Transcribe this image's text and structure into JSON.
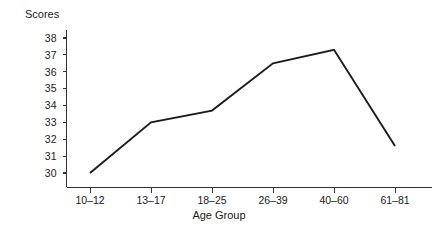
{
  "chart_data": {
    "type": "line",
    "title": "",
    "xlabel": "Age Group",
    "ylabel": "Scores",
    "categories": [
      "10–12",
      "13–17",
      "18–25",
      "26–39",
      "40–60",
      "61–81"
    ],
    "values": [
      30.0,
      33.0,
      33.7,
      36.5,
      37.3,
      31.6
    ],
    "ylim": [
      29.4,
      38.4
    ],
    "yticks": [
      30,
      31,
      32,
      33,
      34,
      35,
      36,
      37,
      38
    ],
    "ytick_labels": [
      "30",
      "31",
      "32",
      "33",
      "34",
      "35",
      "36",
      "37",
      "38"
    ],
    "grid": false,
    "legend": false,
    "series": [
      {
        "name": "Scores",
        "values": [
          30.0,
          33.0,
          33.7,
          36.5,
          37.3,
          31.6
        ],
        "color": "#1b1b1b"
      }
    ]
  },
  "axes": {
    "y_axis_label": "Scores",
    "x_axis_label": "Age Group",
    "line_color": "#1b1b1b",
    "axis_color": "#333333",
    "background_color": "#ffffff"
  }
}
